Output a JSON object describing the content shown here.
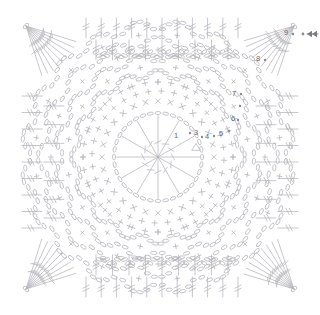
{
  "diagram": {
    "type": "crochet-stitch-chart",
    "shape": "square-motif",
    "background_color": "#ffffff",
    "line_color": "#b4b4bc",
    "label_color": "#6a6a72",
    "canvas": {
      "width": 320,
      "height": 315
    },
    "center": {
      "x": 158,
      "y": 157
    }
  },
  "round_labels": [
    {
      "id": "round-1",
      "text": "1",
      "x": 176,
      "y": 136
    },
    {
      "id": "round-3",
      "text": "3",
      "x": 196,
      "y": 133
    },
    {
      "id": "round-4",
      "text": "4",
      "x": 207,
      "y": 137
    },
    {
      "id": "round-5",
      "text": "5",
      "x": 221,
      "y": 134
    },
    {
      "id": "round-6",
      "text": "6",
      "x": 233,
      "y": 119
    },
    {
      "id": "round-7",
      "text": "7",
      "x": 234,
      "y": 94
    },
    {
      "id": "round-8",
      "text": "8",
      "x": 258,
      "y": 59
    },
    {
      "id": "round-9",
      "text": "9",
      "x": 286,
      "y": 33
    }
  ],
  "markers": {
    "round_dots": [
      {
        "x": 190,
        "y": 133
      },
      {
        "x": 202,
        "y": 137
      },
      {
        "x": 214,
        "y": 136
      },
      {
        "x": 229,
        "y": 131
      },
      {
        "x": 238,
        "y": 120
      },
      {
        "x": 240,
        "y": 106
      },
      {
        "x": 241,
        "y": 94
      },
      {
        "x": 265,
        "y": 60
      },
      {
        "x": 293,
        "y": 34
      }
    ],
    "start_marker": {
      "name": "direction-arrow",
      "dot": {
        "x": 303,
        "y": 34
      },
      "arrow": {
        "x1": 318,
        "y1": 34,
        "x2": 307,
        "y2": 34
      },
      "direction": "left"
    },
    "join_triangle": {
      "x": 196,
      "y": 147
    }
  },
  "structure": {
    "center_ring": {
      "radius": 44,
      "stitch_count": 12,
      "stitch": "treble"
    },
    "rings": [
      {
        "index": 1,
        "radius": 44,
        "type": "ring-chain",
        "stitches": 12,
        "symbol": "treble-spoke"
      },
      {
        "index": 2,
        "radius": 56,
        "type": "x-round",
        "stitches": 28,
        "symbol": "x-stitch"
      },
      {
        "index": 3,
        "radius": 66,
        "type": "plus-round",
        "stitches": 32,
        "symbol": "plus-stitch"
      },
      {
        "index": 4,
        "radius": 80,
        "type": "arc-round",
        "stitches": 16,
        "symbol": "chain-arc"
      },
      {
        "index": 5,
        "radius": 96,
        "type": "arc-round",
        "stitches": 16,
        "symbol": "chain-arc"
      },
      {
        "index": 6,
        "radius": 112,
        "type": "arc-round",
        "stitches": 16,
        "symbol": "chain-arc"
      },
      {
        "index": 7,
        "radius": 128,
        "type": "arc-round",
        "stitches": 20,
        "symbol": "chain-arc"
      },
      {
        "index": 8,
        "radius": 142,
        "type": "square-edge",
        "stitches": 24,
        "symbol": "treble-row"
      }
    ],
    "corners": {
      "count": 4,
      "symbol": "corner-fan",
      "positions": [
        "top-left",
        "top-right",
        "bottom-left",
        "bottom-right"
      ]
    },
    "border_rows": {
      "symbol": "treble-bar",
      "sides": 4,
      "rows_per_side": 4
    }
  }
}
